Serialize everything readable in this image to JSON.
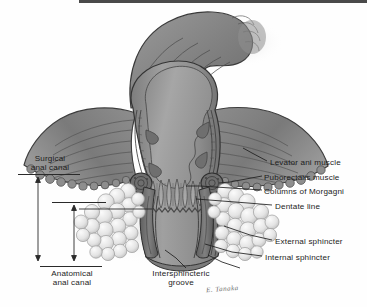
{
  "figure": {
    "kind": "anatomical-illustration",
    "background_color": "#fefefe",
    "ink_color": "#1c1c1c",
    "signature": "E. Tanaka"
  },
  "labels": {
    "levator_ani": "Levator ani muscle",
    "puborectalis": "Puborectalis muscle",
    "columns_morgagni": "Columns of Morgagni",
    "dentate_line": "Dentate line",
    "external_sphincter": "External sphincter",
    "internal_sphincter": "Internal sphincter",
    "surgical_anal_canal_line1": "Surgical",
    "surgical_anal_canal_line2": "anal canal",
    "anatomical_anal_canal_line1": "Anatomical",
    "anatomical_anal_canal_line2": "anal canal",
    "intersphincteric_groove_line1": "Intersphincteric",
    "intersphincteric_groove_line2": "groove"
  },
  "measurements": {
    "surgical_anal_canal": {
      "name": "Surgical anal canal",
      "orientation": "vertical",
      "top_y": 177,
      "bottom_y": 261,
      "x": 38
    },
    "anatomical_anal_canal": {
      "name": "Anatomical anal canal",
      "orientation": "vertical",
      "top_y": 205,
      "bottom_y": 261,
      "x": 74
    }
  },
  "structures": [
    {
      "name": "sigmoid-colon",
      "shade": "#8b8b8b"
    },
    {
      "name": "rectum",
      "shade": "#8f8f8f"
    },
    {
      "name": "rectal-lumen",
      "shade": "#9d9d9d"
    },
    {
      "name": "levator-ani-muscle",
      "shade": "#7e7e7e"
    },
    {
      "name": "puborectalis-muscle",
      "shade": "#6a6a6a"
    },
    {
      "name": "columns-of-morgagni",
      "shade": "#a2a2a2"
    },
    {
      "name": "dentate-line",
      "shade": "#5c5c5c"
    },
    {
      "name": "internal-sphincter",
      "shade": "#707070"
    },
    {
      "name": "external-sphincter",
      "shade": "#e8e8e8"
    },
    {
      "name": "intersphincteric-groove",
      "shade": "#555555"
    }
  ]
}
